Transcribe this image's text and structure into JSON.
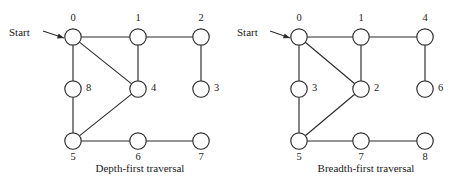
{
  "figure": {
    "background_color": "#ffffff",
    "ink_color": "#2b2b2b",
    "text_color": "#1a1a1a"
  },
  "chart_data": {
    "type": "diagram",
    "title": "",
    "subtitle": "",
    "xlabel": "",
    "ylabel": "",
    "grid": false,
    "legend": "none",
    "panels": [
      {
        "id": "depth-first",
        "caption": "Depth-first traversal",
        "caption_x": 140,
        "caption_y": 172,
        "start_marker": {
          "label": "Start",
          "text_x": 9,
          "text_y": 36,
          "arrow_from_x": 43,
          "arrow_from_y": 31,
          "arrow_to_x": 64,
          "arrow_to_y": 38
        },
        "node_radius": 8.2,
        "nodes": [
          {
            "id": "L0",
            "label": "0",
            "cx": 73,
            "cy": 37,
            "label_x": 73,
            "label_y": 21,
            "label_anchor": "middle"
          },
          {
            "id": "L1",
            "label": "1",
            "cx": 138,
            "cy": 37,
            "label_x": 138,
            "label_y": 21,
            "label_anchor": "middle"
          },
          {
            "id": "L2",
            "label": "2",
            "cx": 201,
            "cy": 37,
            "label_x": 201,
            "label_y": 21,
            "label_anchor": "middle"
          },
          {
            "id": "L8",
            "label": "8",
            "cx": 73,
            "cy": 89,
            "label_x": 86,
            "label_y": 91,
            "label_anchor": "start"
          },
          {
            "id": "L4",
            "label": "4",
            "cx": 138,
            "cy": 89,
            "label_x": 151,
            "label_y": 91,
            "label_anchor": "start"
          },
          {
            "id": "L3",
            "label": "3",
            "cx": 201,
            "cy": 89,
            "label_x": 214,
            "label_y": 91,
            "label_anchor": "start"
          },
          {
            "id": "L5",
            "label": "5",
            "cx": 73,
            "cy": 141,
            "label_x": 73,
            "label_y": 160,
            "label_anchor": "middle"
          },
          {
            "id": "L6",
            "label": "6",
            "cx": 138,
            "cy": 141,
            "label_x": 138,
            "label_y": 160,
            "label_anchor": "middle"
          },
          {
            "id": "L7",
            "label": "7",
            "cx": 201,
            "cy": 141,
            "label_x": 201,
            "label_y": 160,
            "label_anchor": "middle"
          }
        ],
        "edges": [
          {
            "from": "L0",
            "to": "L1"
          },
          {
            "from": "L1",
            "to": "L2"
          },
          {
            "from": "L0",
            "to": "L8"
          },
          {
            "from": "L0",
            "to": "L4"
          },
          {
            "from": "L1",
            "to": "L4"
          },
          {
            "from": "L2",
            "to": "L3"
          },
          {
            "from": "L8",
            "to": "L5"
          },
          {
            "from": "L4",
            "to": "L5"
          },
          {
            "from": "L5",
            "to": "L6"
          },
          {
            "from": "L6",
            "to": "L7"
          }
        ]
      },
      {
        "id": "breadth-first",
        "caption": "Breadth-first traversal",
        "caption_x": 366,
        "caption_y": 172,
        "start_marker": {
          "label": "Start",
          "text_x": 237,
          "text_y": 36,
          "arrow_from_x": 270,
          "arrow_from_y": 31,
          "arrow_to_x": 290,
          "arrow_to_y": 38
        },
        "node_radius": 8.2,
        "nodes": [
          {
            "id": "R0",
            "label": "0",
            "cx": 299,
            "cy": 37,
            "label_x": 299,
            "label_y": 21,
            "label_anchor": "middle"
          },
          {
            "id": "R1",
            "label": "1",
            "cx": 361,
            "cy": 37,
            "label_x": 361,
            "label_y": 21,
            "label_anchor": "middle"
          },
          {
            "id": "R4",
            "label": "4",
            "cx": 425,
            "cy": 37,
            "label_x": 425,
            "label_y": 21,
            "label_anchor": "middle"
          },
          {
            "id": "R3",
            "label": "3",
            "cx": 299,
            "cy": 89,
            "label_x": 312,
            "label_y": 91,
            "label_anchor": "start"
          },
          {
            "id": "R2",
            "label": "2",
            "cx": 361,
            "cy": 89,
            "label_x": 374,
            "label_y": 91,
            "label_anchor": "start"
          },
          {
            "id": "R6",
            "label": "6",
            "cx": 425,
            "cy": 89,
            "label_x": 438,
            "label_y": 91,
            "label_anchor": "start"
          },
          {
            "id": "R5",
            "label": "5",
            "cx": 299,
            "cy": 141,
            "label_x": 299,
            "label_y": 160,
            "label_anchor": "middle"
          },
          {
            "id": "R7",
            "label": "7",
            "cx": 361,
            "cy": 141,
            "label_x": 361,
            "label_y": 160,
            "label_anchor": "middle"
          },
          {
            "id": "R8",
            "label": "8",
            "cx": 425,
            "cy": 141,
            "label_x": 425,
            "label_y": 160,
            "label_anchor": "middle"
          }
        ],
        "edges": [
          {
            "from": "R0",
            "to": "R1"
          },
          {
            "from": "R1",
            "to": "R4"
          },
          {
            "from": "R0",
            "to": "R3"
          },
          {
            "from": "R0",
            "to": "R2"
          },
          {
            "from": "R1",
            "to": "R2"
          },
          {
            "from": "R4",
            "to": "R6"
          },
          {
            "from": "R3",
            "to": "R5"
          },
          {
            "from": "R2",
            "to": "R5"
          },
          {
            "from": "R5",
            "to": "R7"
          },
          {
            "from": "R7",
            "to": "R8"
          }
        ]
      }
    ]
  }
}
